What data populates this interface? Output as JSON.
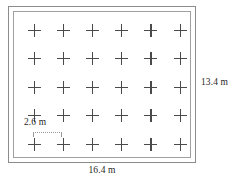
{
  "figure": {
    "type": "scale-diagram",
    "background_color": "#ffffff",
    "line_color": "#8c8c8c",
    "mark_color": "#4a4a4a",
    "text_color": "#1f1f1f"
  },
  "chart_data": {
    "type": "scatter",
    "title": "",
    "xlabel": "16.4 m",
    "ylabel": "13.4 m",
    "grid": false,
    "rows": 5,
    "columns": 6,
    "marker": "plus",
    "x": [
      1,
      2,
      3,
      4,
      5,
      6
    ],
    "y": [
      1,
      2,
      3,
      4,
      5
    ],
    "annotations": [
      "2.6 m",
      "13.4 m",
      "16.4 m"
    ]
  },
  "dimensions": {
    "width_label": "16.4 m",
    "height_label": "13.4 m",
    "spacing_label": "2.6 m"
  },
  "marks": {
    "row_count": 5,
    "column_count": 6,
    "glyph": "plus-mark"
  }
}
